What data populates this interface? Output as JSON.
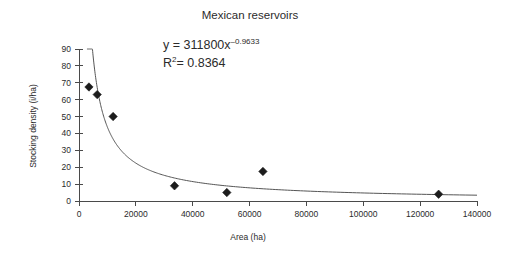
{
  "chart_data": {
    "type": "scatter",
    "title": "Mexican reservoirs",
    "xlabel": "Area (ha)",
    "ylabel": "Stocking density (i/ha)",
    "xlim": [
      0,
      140000
    ],
    "ylim": [
      0,
      90
    ],
    "grid": false,
    "legend": null,
    "x_ticks": [
      0,
      20000,
      40000,
      60000,
      80000,
      100000,
      120000,
      140000
    ],
    "x_tick_labels": [
      "0",
      "20000",
      "40000",
      "60000",
      "80000",
      "100000",
      "120000",
      "140000"
    ],
    "y_ticks": [
      0,
      10,
      20,
      30,
      40,
      50,
      60,
      70,
      80,
      90
    ],
    "y_tick_labels": [
      "0",
      "10",
      "20",
      "30",
      "40",
      "50",
      "60",
      "70",
      "80",
      "90"
    ],
    "series": [
      {
        "name": "Reservoirs",
        "marker": "diamond",
        "color": "#1c1c1c",
        "points": [
          {
            "x": 3500,
            "y": 67.5
          },
          {
            "x": 6400,
            "y": 63.0
          },
          {
            "x": 12000,
            "y": 50.0
          },
          {
            "x": 33600,
            "y": 9.0
          },
          {
            "x": 52000,
            "y": 5.0
          },
          {
            "x": 64700,
            "y": 17.5
          },
          {
            "x": 126500,
            "y": 4.0
          }
        ]
      }
    ],
    "trendline": {
      "type": "power",
      "coefficient": 311800,
      "exponent": -0.9633,
      "r_squared": 0.8364,
      "color": "#555555",
      "x_start": 2800,
      "x_end": 140000
    },
    "annotations": {
      "equation_prefix": "y = 311800x",
      "equation_exponent": "–0.9633",
      "r2_symbol": "R",
      "r2_sup": "2",
      "r2_value": "= 0.8364"
    }
  }
}
